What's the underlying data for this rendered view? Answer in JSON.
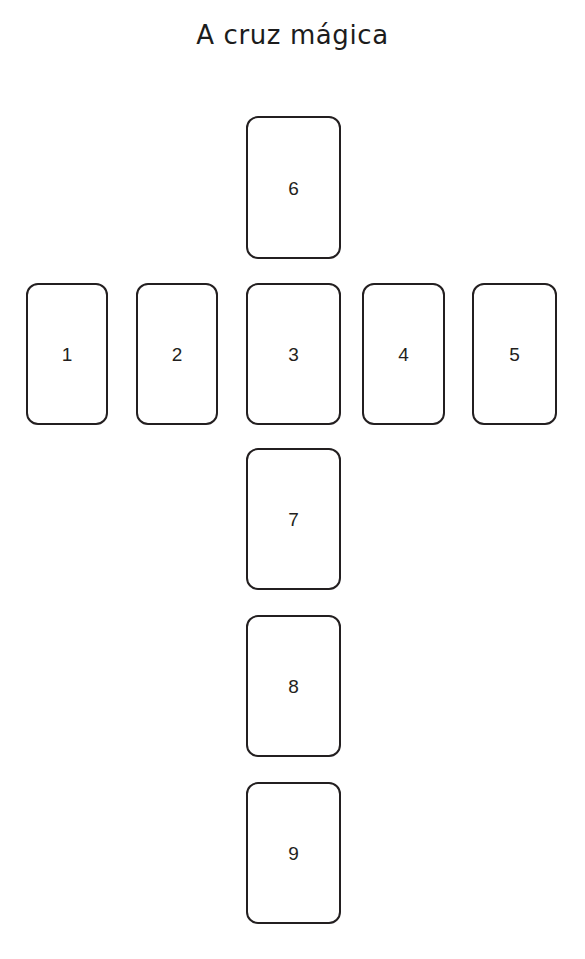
{
  "title": "A cruz mágica",
  "colors": {
    "background": "#ffffff",
    "card_fill": "#ffffff",
    "card_border": "#231f20",
    "text": "#1c1c1c"
  },
  "layout": {
    "shape": "cross",
    "description": "Nine-card cross spread: a vertical column of five cards crossed by a horizontal row of five cards sharing the centre position.",
    "vertical_column_order": [
      "6",
      "3",
      "7",
      "8",
      "9"
    ],
    "horizontal_row_order": [
      "1",
      "2",
      "3",
      "4",
      "5"
    ],
    "intersection_position": "3"
  },
  "cards": [
    {
      "id": "card-6",
      "number": "6",
      "arm": "top",
      "row": 0,
      "column": 2
    },
    {
      "id": "card-1",
      "number": "1",
      "arm": "left-outer",
      "row": 1,
      "column": 0
    },
    {
      "id": "card-2",
      "number": "2",
      "arm": "left-inner",
      "row": 1,
      "column": 1
    },
    {
      "id": "card-3",
      "number": "3",
      "arm": "centre",
      "row": 1,
      "column": 2
    },
    {
      "id": "card-4",
      "number": "4",
      "arm": "right-inner",
      "row": 1,
      "column": 3
    },
    {
      "id": "card-5",
      "number": "5",
      "arm": "right-outer",
      "row": 1,
      "column": 4
    },
    {
      "id": "card-7",
      "number": "7",
      "arm": "bottom-1",
      "row": 2,
      "column": 2
    },
    {
      "id": "card-8",
      "number": "8",
      "arm": "bottom-2",
      "row": 3,
      "column": 2
    },
    {
      "id": "card-9",
      "number": "9",
      "arm": "bottom-3",
      "row": 4,
      "column": 2
    }
  ]
}
